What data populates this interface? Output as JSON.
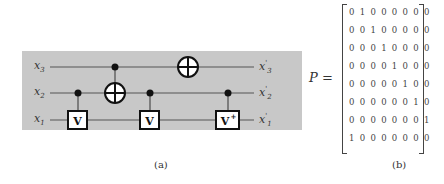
{
  "figure_a": {
    "caption": "(a)",
    "inputs": [
      {
        "var": "x",
        "sub": "3"
      },
      {
        "var": "x",
        "sub": "2"
      },
      {
        "var": "x",
        "sub": "1"
      }
    ],
    "outputs": [
      {
        "var": "x",
        "sub": "3",
        "prime": "'"
      },
      {
        "var": "x",
        "sub": "2",
        "prime": "'"
      },
      {
        "var": "x",
        "sub": "1",
        "prime": "'"
      }
    ],
    "gates": [
      {
        "type": "controlled-V",
        "control": "x2",
        "target": "x1",
        "label": "V"
      },
      {
        "type": "CNOT",
        "control": "x3",
        "target": "x2"
      },
      {
        "type": "controlled-V",
        "control": "x2",
        "target": "x1",
        "label": "V"
      },
      {
        "type": "NOT",
        "target": "x3"
      },
      {
        "type": "controlled-V-dagger",
        "control": "x2",
        "target": "x1",
        "label": "V+"
      }
    ],
    "colors": {
      "background": "#c8c8c8",
      "wire": "#555555",
      "gate": "#111111"
    }
  },
  "figure_b": {
    "caption": "(b)",
    "label": "P =",
    "matrix": [
      "0 1 0 0 0 0 0 0",
      "0 0 1 0 0 0 0 0",
      "0 0 0 1 0 0 0 0",
      "0 0 0 0 1 0 0 0",
      "0 0 0 0 0 1 0 0",
      "0 0 0 0 0 0 1 0",
      "0 0 0 0 0 0 0 1",
      "1 0 0 0 0 0 0 0"
    ]
  }
}
